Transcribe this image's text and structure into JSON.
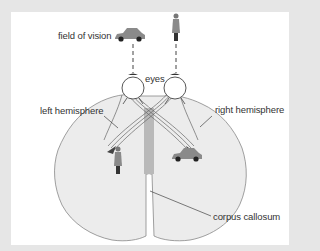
{
  "diagram": {
    "type": "split-brain visual pathway illustration",
    "labels": {
      "field_of_vision": "field of vision",
      "eyes": "eyes",
      "left_hemisphere": "left hemisphere",
      "right_hemisphere": "right hemisphere",
      "corpus_callosum": "corpus callosum"
    },
    "objects": {
      "left_field_object": "car-icon",
      "right_field_object": "person-icon",
      "left_hemisphere_object": "person-icon",
      "right_hemisphere_object": "car-icon"
    },
    "colors": {
      "frame": "#e6e6e6",
      "panel": "#ffffff",
      "brain_fill": "#ececec",
      "brain_outline": "#888888",
      "corpus_callosum": "#b9b9b9",
      "lines": "#444444",
      "objects": "#8a8a8a"
    }
  }
}
